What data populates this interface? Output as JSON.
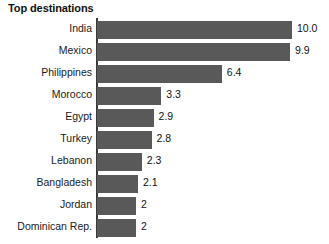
{
  "chart_data": {
    "type": "bar",
    "orientation": "horizontal",
    "title": "Top destinations",
    "xlabel": "",
    "ylabel": "",
    "categories": [
      "India",
      "Mexico",
      "Philippines",
      "Morocco",
      "Egypt",
      "Turkey",
      "Lebanon",
      "Bangladesh",
      "Jordan",
      "Dominican Rep."
    ],
    "values": [
      10.0,
      9.9,
      6.4,
      3.3,
      2.9,
      2.8,
      2.3,
      2.1,
      2,
      2
    ],
    "value_labels": [
      "10.0",
      "9.9",
      "6.4",
      "3.3",
      "2.9",
      "2.8",
      "2.3",
      "2.1",
      "2",
      "2"
    ],
    "xlim": [
      0,
      10.0
    ],
    "grid": false,
    "legend": false,
    "bar_color": "#595959",
    "axis_color": "#3a3a3a",
    "background": "#ffffff"
  }
}
